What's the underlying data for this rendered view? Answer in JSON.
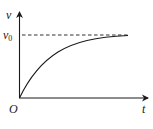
{
  "diagram": {
    "type": "velocity-time graph",
    "axes": {
      "y_label": "v",
      "x_label": "t",
      "origin_label": "O"
    },
    "asymptote": {
      "label_base": "v",
      "label_sub": "0",
      "style": "dashed"
    },
    "curve": {
      "description": "velocity increases from 0 and asymptotically approaches v0"
    },
    "colors": {
      "stroke": "#1a1a1a",
      "background": "#ffffff"
    }
  }
}
